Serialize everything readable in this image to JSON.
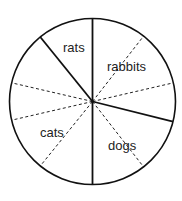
{
  "chart_data": {
    "type": "pie",
    "title": "",
    "categories": [
      "rabbits",
      "dogs",
      "cats",
      "rats"
    ],
    "values": [
      104,
      76,
      141,
      39
    ],
    "units": "degrees",
    "percent": [
      28.9,
      21.1,
      39.2,
      10.8
    ],
    "start_angle_deg": 0,
    "direction": "clockwise",
    "legend": "none (labels inside slices)",
    "guide_lines_dashed_deg": [
      38,
      77,
      142,
      219,
      257,
      283
    ],
    "slice_boundaries_solid_deg": [
      0,
      104,
      180,
      321
    ]
  },
  "geometry": {
    "cx": 92.5,
    "cy": 101.5,
    "r": 83
  },
  "labels": [
    {
      "text": "rats",
      "x": 63,
      "y": 52
    },
    {
      "text": "rabbits",
      "x": 107,
      "y": 71
    },
    {
      "text": "cats",
      "x": 40,
      "y": 137
    },
    {
      "text": "dogs",
      "x": 108,
      "y": 150
    }
  ],
  "colors": {
    "outline": "#111111",
    "solid_divider": "#111111",
    "dashed_guide": "#222222",
    "fill": "#ffffff",
    "label": "#222222"
  }
}
